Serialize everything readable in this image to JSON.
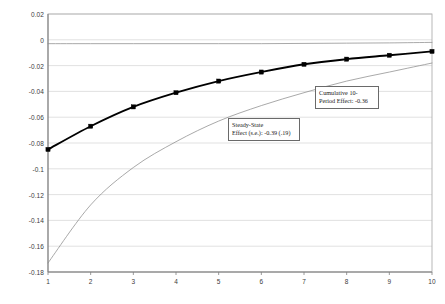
{
  "chart_data": {
    "type": "line",
    "title": "",
    "subtitle": "",
    "xlabel": "",
    "ylabel": "",
    "x": [
      1,
      2,
      3,
      4,
      5,
      6,
      7,
      8,
      9,
      10
    ],
    "xlim": [
      1,
      10
    ],
    "ylim": [
      -0.18,
      0.02
    ],
    "grid": true,
    "legend": "none",
    "y_ticks": [
      "0.02",
      "0",
      "-0.02",
      "-0.04",
      "-0.06",
      "-0.08",
      "-0.1",
      "-0.12",
      "-0.14",
      "-0.16",
      "-0.18"
    ],
    "y_tick_values": [
      0.02,
      0,
      -0.02,
      -0.04,
      -0.06,
      -0.08,
      -0.1,
      -0.12,
      -0.14,
      -0.16,
      -0.18
    ],
    "x_ticks": [
      "1",
      "2",
      "3",
      "4",
      "5",
      "6",
      "7",
      "8",
      "9",
      "10"
    ],
    "series": [
      {
        "name": "upper-confidence-band",
        "style": "thin-line",
        "marker": "none",
        "color": "#999999",
        "values": [
          -0.003,
          -0.003,
          -0.003,
          -0.003,
          -0.003,
          -0.003,
          -0.0028,
          -0.0026,
          -0.0024,
          -0.002
        ]
      },
      {
        "name": "point-estimate",
        "style": "thick-line",
        "marker": "square",
        "color": "#000000",
        "values": [
          -0.085,
          -0.067,
          -0.052,
          -0.041,
          -0.032,
          -0.025,
          -0.019,
          -0.015,
          -0.012,
          -0.009
        ]
      },
      {
        "name": "lower-confidence-band",
        "style": "thin-line",
        "marker": "none",
        "color": "#999999",
        "values": [
          -0.173,
          -0.128,
          -0.099,
          -0.079,
          -0.063,
          -0.051,
          -0.041,
          -0.032,
          -0.025,
          -0.018
        ]
      }
    ],
    "annotations": [
      {
        "name": "steady-state-effect",
        "line1": "Steady-State",
        "line2": "Effect (s.e.): -0.39 (.19)",
        "x_px": 228,
        "y_px": 118,
        "w_px": 72,
        "h_px": 22
      },
      {
        "name": "cumulative-effect",
        "line1": "Cumulative 10-",
        "line2": "Period Effect: -0.36",
        "x_px": 315,
        "y_px": 86,
        "w_px": 64,
        "h_px": 22
      }
    ]
  },
  "colors": {
    "plot_border": "#b0b0b0",
    "gridline": "#d9d9d9",
    "axis_line": "#808080",
    "thick_series": "#000000",
    "thin_series": "#8c8c8c",
    "tick_text": "#3b3b3b"
  }
}
